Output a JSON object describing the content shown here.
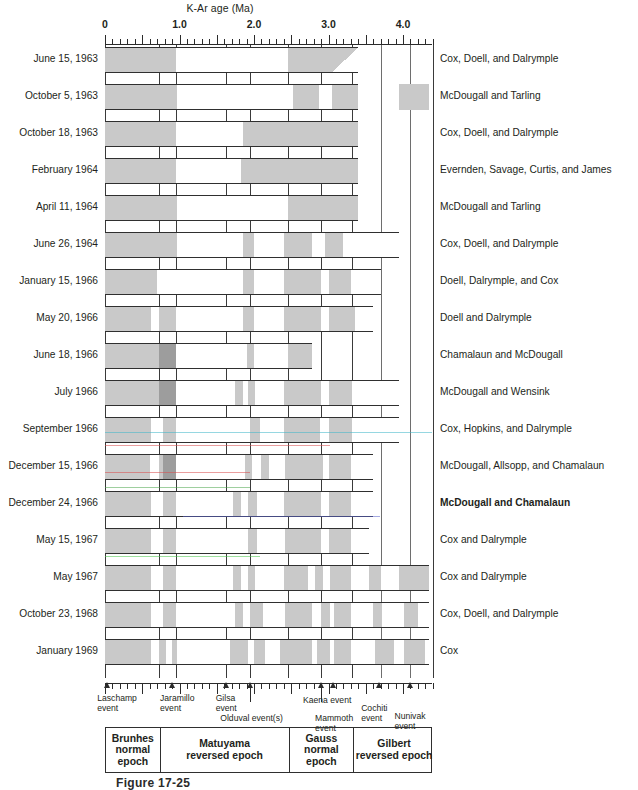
{
  "figure": {
    "axis_title": "K-Ar age (Ma)",
    "caption": "Figure 17-25",
    "axis": {
      "min_ma": 0,
      "max_ma": 4.4,
      "tick_labels": [
        "0",
        "1.0",
        "2.0",
        "3.0",
        "4.0"
      ],
      "tick_values": [
        0,
        1.0,
        2.0,
        3.0,
        4.0
      ],
      "minor_tick_step_ma": 0.1
    },
    "colors": {
      "normal_polarity": "#c9c9c9",
      "reversed_polarity": "#ffffff",
      "dark_event": "#9d9d9d",
      "line": "#2f2f2f",
      "text": "#231f20"
    },
    "legend_note": {
      "normal": "gray = normal polarity",
      "reversed": "white = reversed polarity"
    }
  },
  "chart_data": {
    "type": "bar",
    "xlabel": "K-Ar age (Ma)",
    "ylabel": "",
    "xlim": [
      0,
      4.4
    ],
    "grid": true,
    "legend": "right",
    "categories": [
      "June 15, 1963",
      "October 5, 1963",
      "October 18, 1963",
      "February 1964",
      "April 11, 1964",
      "June 26, 1964",
      "January 15, 1966",
      "May 20, 1966",
      "June 18, 1966",
      "July 1966",
      "September 1966",
      "December 15, 1966",
      "December 24, 1966",
      "May 15, 1967",
      "May 1967",
      "October 23, 1968",
      "January 1969"
    ],
    "series": [
      {
        "name": "June 15, 1963",
        "authors": "Cox, Doell, and Dalrymple",
        "extent_ma": [
          0,
          3.4
        ],
        "normal_intervals_ma": [
          [
            0,
            0.95
          ],
          [
            2.45,
            3.05
          ]
        ],
        "wedge_ma": [
          3.05,
          3.4
        ]
      },
      {
        "name": "October 5, 1963",
        "authors": "McDougall and Tarling",
        "extent_ma": [
          0,
          3.4
        ],
        "normal_intervals_ma": [
          [
            0,
            0.97
          ],
          [
            2.53,
            2.87
          ],
          [
            3.05,
            3.4
          ]
        ],
        "extra_segment_ma": [
          3.95,
          4.35
        ],
        "extra_normal_ma": [
          [
            3.95,
            4.35
          ]
        ]
      },
      {
        "name": "October 18, 1963",
        "authors": "Cox, Doell, and Dalrymple",
        "extent_ma": [
          0,
          3.4
        ],
        "normal_intervals_ma": [
          [
            0,
            0.95
          ],
          [
            1.85,
            3.4
          ]
        ]
      },
      {
        "name": "February 1964",
        "authors": "Evernden, Savage, Curtis, and James",
        "extent_ma": [
          0,
          3.4
        ],
        "normal_intervals_ma": [
          [
            0,
            0.95
          ],
          [
            1.83,
            3.4
          ]
        ]
      },
      {
        "name": "April 11, 1964",
        "authors": "McDougall and Tarling",
        "extent_ma": [
          0,
          3.4
        ],
        "normal_intervals_ma": [
          [
            0,
            0.97
          ],
          [
            2.45,
            3.4
          ]
        ]
      },
      {
        "name": "June 26, 1964",
        "authors": "Cox, Doell, and Dalrymple",
        "extent_ma": [
          0,
          3.95
        ],
        "normal_intervals_ma": [
          [
            0,
            0.97
          ],
          [
            1.85,
            2.0
          ],
          [
            2.4,
            2.78
          ],
          [
            2.95,
            3.2
          ]
        ]
      },
      {
        "name": "January 15, 1966",
        "authors": "Doell, Dalrymple, and Cox",
        "extent_ma": [
          0,
          3.7
        ],
        "normal_intervals_ma": [
          [
            0,
            0.7
          ],
          [
            1.85,
            2.0
          ],
          [
            2.4,
            2.9
          ],
          [
            3.0,
            3.3
          ]
        ]
      },
      {
        "name": "May 20, 1966",
        "authors": "Doell and Dalrymple",
        "extent_ma": [
          0,
          3.6
        ],
        "normal_intervals_ma": [
          [
            0,
            0.62
          ],
          [
            0.72,
            0.95
          ],
          [
            1.85,
            2.0
          ],
          [
            2.4,
            2.9
          ],
          [
            3.0,
            3.35
          ]
        ]
      },
      {
        "name": "June 18, 1966",
        "authors": "Chamalaun and McDougall",
        "extent_ma": [
          0,
          2.78
        ],
        "normal_intervals_ma": [
          [
            0,
            0.95
          ],
          [
            1.9,
            2.0
          ],
          [
            2.45,
            2.78
          ]
        ],
        "dark_intervals_ma": [
          [
            0.72,
            0.95
          ]
        ]
      },
      {
        "name": "July 1966",
        "authors": "McDougall and Wensink",
        "extent_ma": [
          0,
          3.95
        ],
        "normal_intervals_ma": [
          [
            0,
            0.95
          ],
          [
            1.75,
            1.85
          ],
          [
            1.92,
            2.02
          ],
          [
            2.4,
            2.9
          ],
          [
            3.0,
            3.32
          ]
        ],
        "dark_intervals_ma": [
          [
            0.72,
            0.95
          ]
        ]
      },
      {
        "name": "September 1966",
        "authors": "Cox, Hopkins, and Dalrymple",
        "extent_ma": [
          0,
          3.95
        ],
        "normal_intervals_ma": [
          [
            0,
            0.62
          ],
          [
            0.78,
            0.95
          ],
          [
            1.95,
            2.08
          ],
          [
            2.4,
            2.88
          ],
          [
            3.0,
            3.32
          ]
        ]
      },
      {
        "name": "December 15, 1966",
        "authors": "McDougall, Allsopp, and Chamalaun",
        "extent_ma": [
          0,
          3.6
        ],
        "normal_intervals_ma": [
          [
            0,
            0.6
          ],
          [
            0.72,
            0.95
          ],
          [
            1.88,
            1.98
          ],
          [
            2.1,
            2.2
          ],
          [
            2.42,
            2.92
          ],
          [
            3.0,
            3.3
          ]
        ],
        "dark_intervals_ma": [
          [
            0.78,
            0.95
          ]
        ]
      },
      {
        "name": "December 24, 1966",
        "authors": "McDougall and Chamalaun",
        "authors_bold": true,
        "extent_ma": [
          0,
          3.6
        ],
        "normal_intervals_ma": [
          [
            0,
            0.62
          ],
          [
            0.78,
            0.95
          ],
          [
            1.72,
            1.82
          ],
          [
            1.92,
            2.04
          ],
          [
            2.4,
            2.9
          ],
          [
            3.0,
            3.3
          ]
        ]
      },
      {
        "name": "May 15, 1967",
        "authors": "Cox and Dalrymple",
        "extent_ma": [
          0,
          3.55
        ],
        "normal_intervals_ma": [
          [
            0,
            0.62
          ],
          [
            0.78,
            0.95
          ],
          [
            1.92,
            2.04
          ],
          [
            2.42,
            2.9
          ],
          [
            3.0,
            3.3
          ]
        ]
      },
      {
        "name": "May 1967",
        "authors": "Cox and Dalrymple",
        "extent_ma": [
          0,
          4.35
        ],
        "normal_intervals_ma": [
          [
            0,
            0.62
          ],
          [
            0.78,
            0.95
          ],
          [
            1.72,
            1.82
          ],
          [
            1.92,
            2.02
          ],
          [
            2.4,
            2.72
          ],
          [
            2.82,
            2.92
          ],
          [
            3.02,
            3.3
          ],
          [
            3.55,
            3.7
          ],
          [
            3.95,
            4.35
          ]
        ]
      },
      {
        "name": "October 23, 1968",
        "authors": "Cox, Doell, and Dalrymple",
        "extent_ma": [
          0,
          4.35
        ],
        "normal_intervals_ma": [
          [
            0,
            0.62
          ],
          [
            0.78,
            0.95
          ],
          [
            1.75,
            1.85
          ],
          [
            1.95,
            2.12
          ],
          [
            2.42,
            2.78
          ],
          [
            2.9,
            3.02
          ],
          [
            3.08,
            3.3
          ],
          [
            3.6,
            3.72
          ],
          [
            4.02,
            4.2
          ]
        ]
      },
      {
        "name": "January 1969",
        "authors": "Cox",
        "extent_ma": [
          0,
          4.35
        ],
        "normal_intervals_ma": [
          [
            0,
            0.62
          ],
          [
            0.72,
            0.82
          ],
          [
            0.9,
            0.97
          ],
          [
            1.68,
            1.92
          ],
          [
            2.0,
            2.15
          ],
          [
            2.35,
            2.78
          ],
          [
            2.85,
            3.02
          ],
          [
            3.08,
            3.3
          ],
          [
            3.62,
            3.88
          ],
          [
            4.02,
            4.3
          ]
        ]
      }
    ]
  },
  "rows": [
    {
      "date": "June 15, 1963",
      "authors": "Cox, Doell, and Dalrymple"
    },
    {
      "date": "October 5, 1963",
      "authors": "McDougall and Tarling"
    },
    {
      "date": "October 18, 1963",
      "authors": "Cox, Doell, and Dalrymple"
    },
    {
      "date": "February 1964",
      "authors": "Evernden, Savage, Curtis, and James"
    },
    {
      "date": "April 11, 1964",
      "authors": "McDougall and Tarling"
    },
    {
      "date": "June 26, 1964",
      "authors": "Cox, Doell, and Dalrymple"
    },
    {
      "date": "January 15, 1966",
      "authors": "Doell, Dalrymple, and Cox"
    },
    {
      "date": "May 20, 1966",
      "authors": "Doell and Dalrymple"
    },
    {
      "date": "June 18, 1966",
      "authors": "Chamalaun and McDougall"
    },
    {
      "date": "July 1966",
      "authors": "McDougall and Wensink"
    },
    {
      "date": "September 1966",
      "authors": "Cox, Hopkins, and Dalrymple"
    },
    {
      "date": "December 15, 1966",
      "authors": "McDougall, Allsopp, and Chamalaun"
    },
    {
      "date": "December 24, 1966",
      "authors": "McDougall and Chamalaun"
    },
    {
      "date": "May 15, 1967",
      "authors": "Cox and Dalrymple"
    },
    {
      "date": "May 1967",
      "authors": "Cox and Dalrymple"
    },
    {
      "date": "October 23, 1968",
      "authors": "Cox, Doell, and Dalrymple"
    },
    {
      "date": "January 1969",
      "authors": "Cox"
    }
  ],
  "events": [
    {
      "name": "Laschamp event",
      "label_line1": "Laschamp",
      "label_line2": "event",
      "age_ma": 0.03
    },
    {
      "name": "Jaramillo event",
      "label_line1": "Jaramillo",
      "label_line2": "event",
      "age_ma": 0.9
    },
    {
      "name": "Gilsa event",
      "label_line1": "Gilsa",
      "label_line2": "event",
      "age_ma": 1.62
    },
    {
      "name": "Olduval event(s)",
      "label_line1": "Olduval event(s)",
      "label_line2": "",
      "age_ma": 1.95
    },
    {
      "name": "Kaena event",
      "label_line1": "Kaena event",
      "label_line2": "",
      "age_ma": 2.9
    },
    {
      "name": "Mammoth event",
      "label_line1": "Mammoth",
      "label_line2": "event",
      "age_ma": 3.06
    },
    {
      "name": "Cochiti event",
      "label_line1": "Cochiti",
      "label_line2": "event",
      "age_ma": 3.68
    },
    {
      "name": "Nunivak event",
      "label_line1": "Nunivak",
      "label_line2": "event",
      "age_ma": 4.1
    }
  ],
  "epochs": [
    {
      "name": "Brunhes normal epoch",
      "line1": "Brunhes",
      "line2": "normal",
      "line3": "epoch",
      "start_ma": 0,
      "end_ma": 0.72
    },
    {
      "name": "Matuyama reversed epoch",
      "line1": "Matuyama",
      "line2": "reversed epoch",
      "line3": "",
      "start_ma": 0.72,
      "end_ma": 2.45
    },
    {
      "name": "Gauss normal epoch",
      "line1": "Gauss",
      "line2": "normal",
      "line3": "epoch",
      "start_ma": 2.45,
      "end_ma": 3.32
    },
    {
      "name": "Gilbert reversed epoch",
      "line1": "Gilbert",
      "line2": "reversed epoch",
      "line3": "",
      "start_ma": 3.32,
      "end_ma": 4.4
    }
  ],
  "artifacts": [
    {
      "color": "#3fb6c8",
      "y": 432,
      "x_start": 105,
      "x_end": 432
    },
    {
      "color": "#d94f4f",
      "y": 445,
      "x_start": 105,
      "x_end": 330
    },
    {
      "color": "#d94f4f",
      "y": 472,
      "x_start": 105,
      "x_end": 250
    },
    {
      "color": "#4fa84f",
      "y": 487,
      "x_start": 105,
      "x_end": 250
    },
    {
      "color": "#5a63c8",
      "y": 516,
      "x_start": 183,
      "x_end": 380
    },
    {
      "color": "#4fc84f",
      "y": 556,
      "x_start": 105,
      "x_end": 260
    }
  ]
}
